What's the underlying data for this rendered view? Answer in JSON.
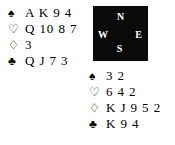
{
  "diagram": {
    "type": "bridge-hand-diagram",
    "background_color": "#ffffff",
    "text_color": "#000000"
  },
  "compass": {
    "box_color": "#0a0a0a",
    "label_color": "#ffffff",
    "north": "N",
    "west": "W",
    "east": "E",
    "south": "S"
  },
  "hands": {
    "north": {
      "position_label": "N",
      "suits": [
        {
          "icon": "spade-icon",
          "symbol": "♠",
          "filled": true,
          "cards": "A K 9 4"
        },
        {
          "icon": "heart-icon",
          "symbol": "♡",
          "filled": false,
          "cards": "Q 10 8 7"
        },
        {
          "icon": "diamond-icon",
          "symbol": "♢",
          "filled": false,
          "cards": "3"
        },
        {
          "icon": "club-icon",
          "symbol": "♣",
          "filled": true,
          "cards": "Q J 7 3"
        }
      ]
    },
    "south": {
      "position_label": "S",
      "suits": [
        {
          "icon": "spade-icon",
          "symbol": "♠",
          "filled": true,
          "cards": "3 2"
        },
        {
          "icon": "heart-icon",
          "symbol": "♡",
          "filled": false,
          "cards": "6 4 2"
        },
        {
          "icon": "diamond-icon",
          "symbol": "♢",
          "filled": false,
          "cards": "K J 9 5 2"
        },
        {
          "icon": "club-icon",
          "symbol": "♣",
          "filled": true,
          "cards": "K 9 4"
        }
      ]
    }
  }
}
